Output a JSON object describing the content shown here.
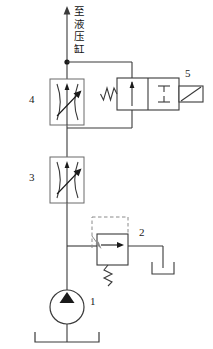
{
  "diagram": {
    "caption": {
      "name": "to-hydraulic-cylinder",
      "chars": [
        "至",
        "液",
        "压",
        "缸"
      ],
      "full_text": "至液压缸"
    },
    "stroke_color": "#3a3a3a",
    "fill_color": "#000000",
    "background": "#ffffff",
    "components": [
      {
        "id": "1",
        "label": "1",
        "name": "hydraulic-pump",
        "type": "pump",
        "symbol": "circle-with-filled-triangle"
      },
      {
        "id": "2",
        "label": "2",
        "name": "relief-valve",
        "type": "pressure-relief-valve",
        "symbol": "box-with-arrow-spring-and-pilot-line"
      },
      {
        "id": "3",
        "label": "3",
        "name": "throttle-valve-lower",
        "type": "adjustable-throttle-valve",
        "symbol": "box-with-opposing-curves-and-diagonal-arrow"
      },
      {
        "id": "4",
        "label": "4",
        "name": "throttle-valve-upper",
        "type": "adjustable-throttle-valve",
        "symbol": "box-with-opposing-curves-and-diagonal-arrow"
      },
      {
        "id": "5",
        "label": "5",
        "name": "directional-valve",
        "type": "two-position-two-way-solenoid-valve",
        "symbol": "two-square-box-spring-left-solenoid-right"
      }
    ],
    "labels": {
      "pump": "1",
      "relief_valve": "2",
      "throttle_lower": "3",
      "throttle_upper": "4",
      "directional_valve": "5"
    }
  }
}
